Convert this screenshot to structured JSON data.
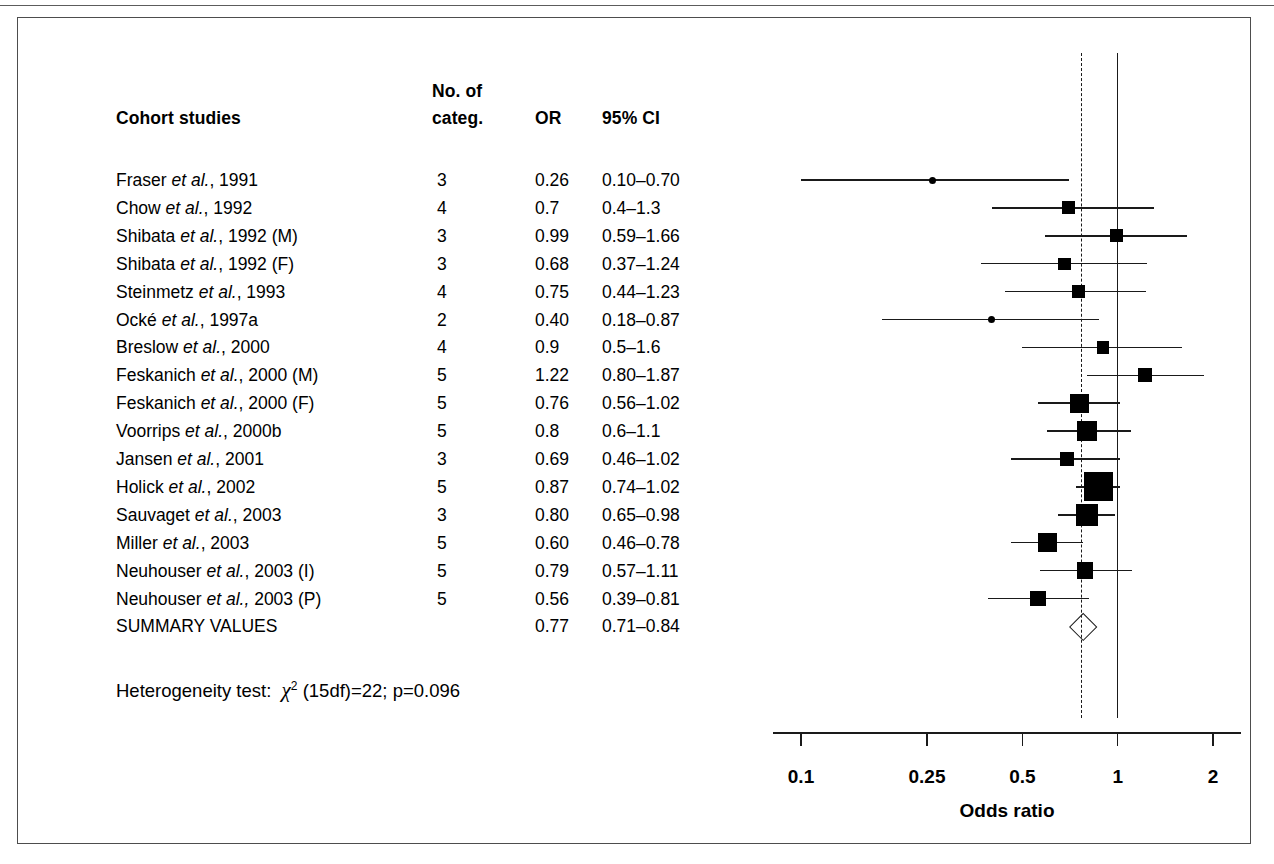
{
  "figure": {
    "kind": "forest-plot",
    "group_label": "Cohort studies"
  },
  "table": {
    "headers": {
      "study": "Cohort studies",
      "noof": "No. of",
      "categ": "categ.",
      "or": "OR",
      "ci": "95% CI"
    }
  },
  "heterogeneity": {
    "prefix": "Heterogeneity test:",
    "chi": "χ",
    "sup": "2",
    "rest": "(15df)=22; p=0.096",
    "df": 15,
    "chi_square": 22,
    "p_value": 0.096
  },
  "axis": {
    "title": "Odds ratio",
    "ticks": [
      "0.1",
      "0.25",
      "0.5",
      "1",
      "2"
    ],
    "tick_values": [
      0.1,
      0.25,
      0.5,
      1,
      2
    ],
    "scale": "log",
    "null_value": 1,
    "summary_line_value": 0.77
  },
  "colors": {
    "ink": "#000000",
    "rule": "#5c5c5c",
    "frame": "#4d4d4d"
  },
  "chart_data": {
    "type": "forest",
    "title": "Cohort studies",
    "xlabel": "Odds ratio",
    "ylabel": "",
    "xscale": "log",
    "xlim": [
      0.1,
      2
    ],
    "xticks": [
      0.1,
      0.25,
      0.5,
      1,
      2
    ],
    "null_line": 1,
    "summary_line": 0.77,
    "grid": false,
    "legend": "none",
    "columns": [
      "Cohort studies",
      "No. of categ.",
      "OR",
      "95% CI"
    ],
    "rows": [
      {
        "study_prefix": "Fraser ",
        "study_italic": "et al.",
        "study_suffix": ", 1991",
        "categ": "3",
        "or_text": "0.26",
        "ci_text": "0.10–0.70",
        "or": 0.26,
        "lcl": 0.1,
        "ucl": 0.7,
        "weight": 4,
        "marker": "dot"
      },
      {
        "study_prefix": "Chow ",
        "study_italic": "et al.",
        "study_suffix": ", 1992",
        "categ": "4",
        "or_text": "0.7",
        "ci_text": "0.4–1.3",
        "or": 0.7,
        "lcl": 0.4,
        "ucl": 1.3,
        "weight": 10,
        "marker": "square"
      },
      {
        "study_prefix": "Shibata ",
        "study_italic": "et al.",
        "study_suffix": ", 1992 (M)",
        "categ": "3",
        "or_text": "0.99",
        "ci_text": "0.59–1.66",
        "or": 0.99,
        "lcl": 0.59,
        "ucl": 1.66,
        "weight": 10,
        "marker": "square"
      },
      {
        "study_prefix": "Shibata ",
        "study_italic": "et al.",
        "study_suffix": ", 1992 (F)",
        "categ": "3",
        "or_text": "0.68",
        "ci_text": "0.37–1.24",
        "or": 0.68,
        "lcl": 0.37,
        "ucl": 1.24,
        "weight": 9,
        "marker": "square"
      },
      {
        "study_prefix": "Steinmetz ",
        "study_italic": "et al.",
        "study_suffix": ", 1993",
        "categ": "4",
        "or_text": "0.75",
        "ci_text": "0.44–1.23",
        "or": 0.75,
        "lcl": 0.44,
        "ucl": 1.23,
        "weight": 10,
        "marker": "square"
      },
      {
        "study_prefix": "Ocké ",
        "study_italic": "et al.",
        "study_suffix": ", 1997a",
        "categ": "2",
        "or_text": "0.40",
        "ci_text": "0.18–0.87",
        "or": 0.4,
        "lcl": 0.18,
        "ucl": 0.87,
        "weight": 4,
        "marker": "dot"
      },
      {
        "study_prefix": "Breslow ",
        "study_italic": "et al.",
        "study_suffix": ", 2000",
        "categ": "4",
        "or_text": "0.9",
        "ci_text": "0.5–1.6",
        "or": 0.9,
        "lcl": 0.5,
        "ucl": 1.6,
        "weight": 9,
        "marker": "square"
      },
      {
        "study_prefix": "Feskanich ",
        "study_italic": "et al.",
        "study_suffix": ", 2000 (M)",
        "categ": "5",
        "or_text": "1.22",
        "ci_text": "0.80–1.87",
        "or": 1.22,
        "lcl": 0.8,
        "ucl": 1.87,
        "weight": 11,
        "marker": "square"
      },
      {
        "study_prefix": "Feskanich ",
        "study_italic": "et al.",
        "study_suffix": ", 2000 (F)",
        "categ": "5",
        "or_text": "0.76",
        "ci_text": "0.56–1.02",
        "or": 0.76,
        "lcl": 0.56,
        "ucl": 1.02,
        "weight": 17,
        "marker": "square"
      },
      {
        "study_prefix": "Voorrips ",
        "study_italic": "et al.",
        "study_suffix": ", 2000b",
        "categ": "5",
        "or_text": "0.8",
        "ci_text": "0.6–1.1",
        "or": 0.8,
        "lcl": 0.6,
        "ucl": 1.1,
        "weight": 18,
        "marker": "square"
      },
      {
        "study_prefix": "Jansen ",
        "study_italic": "et al.",
        "study_suffix": ", 2001",
        "categ": "3",
        "or_text": "0.69",
        "ci_text": "0.46–1.02",
        "or": 0.69,
        "lcl": 0.46,
        "ucl": 1.02,
        "weight": 11,
        "marker": "square"
      },
      {
        "study_prefix": "Holick ",
        "study_italic": "et al.",
        "study_suffix": ", 2002",
        "categ": "5",
        "or_text": "0.87",
        "ci_text": "0.74–1.02",
        "or": 0.87,
        "lcl": 0.74,
        "ucl": 1.02,
        "weight": 30,
        "marker": "square"
      },
      {
        "study_prefix": "Sauvaget ",
        "study_italic": "et al.",
        "study_suffix": ", 2003",
        "categ": "3",
        "or_text": "0.80",
        "ci_text": "0.65–0.98",
        "or": 0.8,
        "lcl": 0.65,
        "ucl": 0.98,
        "weight": 21,
        "marker": "square"
      },
      {
        "study_prefix": "Miller ",
        "study_italic": "et al.",
        "study_suffix": ", 2003",
        "categ": "5",
        "or_text": "0.60",
        "ci_text": "0.46–0.78",
        "or": 0.6,
        "lcl": 0.46,
        "ucl": 0.78,
        "weight": 17,
        "marker": "square"
      },
      {
        "study_prefix": "Neuhouser ",
        "study_italic": "et al.",
        "study_suffix": ", 2003 (I)",
        "categ": "5",
        "or_text": "0.79",
        "ci_text": "0.57–1.11",
        "or": 0.79,
        "lcl": 0.57,
        "ucl": 1.11,
        "weight": 14,
        "marker": "square"
      },
      {
        "study_prefix": "Neuhouser ",
        "study_italic": "et al.,",
        "study_suffix": " 2003 (P)",
        "categ": "5",
        "or_text": "0.56",
        "ci_text": "0.39–0.81",
        "or": 0.56,
        "lcl": 0.39,
        "ucl": 0.81,
        "weight": 13,
        "marker": "square"
      },
      {
        "study_prefix": "SUMMARY VALUES",
        "study_italic": "",
        "study_suffix": "",
        "categ": "",
        "or_text": "0.77",
        "ci_text": "0.71–0.84",
        "or": 0.77,
        "lcl": 0.71,
        "ucl": 0.84,
        "weight": 0,
        "marker": "diamond"
      }
    ]
  }
}
